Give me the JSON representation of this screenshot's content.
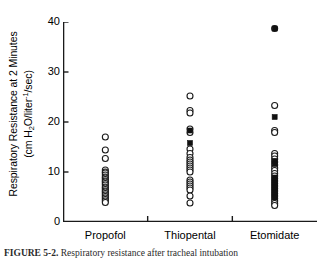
{
  "figure": {
    "caption_label": "FIGURE 5-2.",
    "caption_text": "Respiratory resistance after tracheal intubation"
  },
  "axes": {
    "y_title_line1": "Respiratory Resistance at 2 Minutes",
    "y_title_line2_prefix": "(cm H",
    "y_title_line2_sub": "2",
    "y_title_line2_mid": "O/liter",
    "y_title_line2_sup": "-1",
    "y_title_line2_suffix": "/sec)",
    "y_ticks": [
      "0",
      "10",
      "20",
      "30",
      "40"
    ],
    "x_categories": [
      "Propofol",
      "Thiopental",
      "Etomidate"
    ]
  },
  "colors": {
    "axis": "#1a1a1a",
    "open_marker_stroke": "#1a1a1a",
    "open_marker_fill": "#ffffff",
    "filled_marker": "#111111",
    "background": "#ffffff"
  },
  "chart_data": {
    "type": "scatter",
    "title": "",
    "xlabel": "",
    "ylabel": "Respiratory Resistance at 2 Minutes (cm H2O/liter-1/sec)",
    "ylim": [
      0,
      40
    ],
    "yticks": [
      0,
      10,
      20,
      30,
      40
    ],
    "grid": false,
    "legend": "none",
    "categories": [
      "Propofol",
      "Thiopental",
      "Etomidate"
    ],
    "marker_types": {
      "open_circle": "individual patient value",
      "filled_square": "individual patient value (highlighted subset)"
    },
    "series": [
      {
        "name": "Propofol",
        "category_index": 0,
        "open_circle_values": [
          17.0,
          14.4,
          12.7,
          10.4,
          10.0,
          9.8,
          9.4,
          9.0,
          8.8,
          8.5,
          8.2,
          8.0,
          7.7,
          7.4,
          7.0,
          6.8,
          6.5,
          6.2,
          6.0,
          5.7,
          5.4,
          5.1,
          4.8,
          4.5,
          4.2,
          3.9
        ],
        "filled_square_values": []
      },
      {
        "name": "Thiopental",
        "category_index": 1,
        "open_circle_values": [
          25.2,
          22.3,
          21.8,
          18.6,
          17.9,
          14.6,
          13.7,
          12.9,
          12.4,
          12.0,
          11.6,
          11.2,
          10.8,
          10.4,
          10.0,
          8.4,
          8.0,
          7.6,
          7.2,
          6.8,
          6.4,
          5.2,
          3.8
        ],
        "filled_square_values": [
          18.3,
          15.8
        ]
      },
      {
        "name": "Etomidate",
        "category_index": 2,
        "open_circle_values": [
          38.7,
          23.3,
          18.3,
          17.9,
          13.7,
          13.2,
          12.6,
          12.0,
          11.4,
          10.8,
          10.3,
          9.7,
          9.2,
          8.7,
          8.2,
          7.7,
          7.2,
          6.7,
          6.2,
          5.7,
          5.2,
          4.7,
          4.2,
          3.7,
          3.3
        ],
        "filled_square_values": [
          38.7,
          21.0,
          12.2,
          11.6,
          8.9,
          8.4,
          7.9,
          7.4,
          6.9,
          6.4,
          5.9,
          5.4,
          4.9
        ]
      }
    ]
  }
}
